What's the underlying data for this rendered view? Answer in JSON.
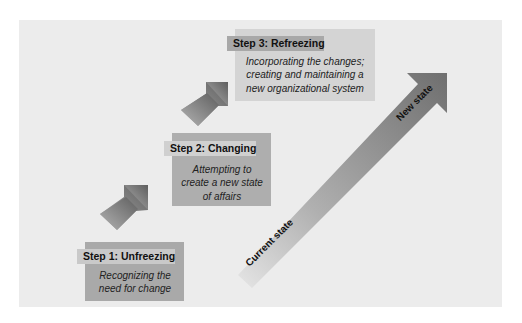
{
  "diagram": {
    "steps": [
      {
        "heading": "Step 1: Unfreezing",
        "description_lines": [
          "Recognizing the",
          "need for change"
        ]
      },
      {
        "heading": "Step 2: Changing",
        "description_lines": [
          "Attempting to",
          "create a new state",
          "of affairs"
        ]
      },
      {
        "heading": "Step 3: Refreezing",
        "description_lines": [
          "Incorporating the changes;",
          "creating and maintaining a",
          "new organizational system"
        ]
      }
    ],
    "progress_arrow": {
      "start_label": "Current state",
      "end_label": "New state"
    },
    "colors": {
      "panel_bg": "#ececec",
      "arrow_dark": "#6f6f6f",
      "arrow_light": "#bdbdbd",
      "step1_box": "#a9a9a9",
      "step2_box": "#aeaeae",
      "step3_box": "#d4d4d4"
    }
  }
}
